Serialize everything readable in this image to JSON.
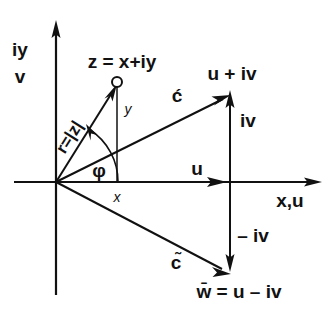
{
  "figure": {
    "colors": {
      "ink": "#111111",
      "background": "#ffffff"
    },
    "axes": {
      "vertical": {
        "label_line1": "iy",
        "label_line2": "v"
      },
      "horizontal": {
        "label": "x,u"
      }
    },
    "labels": {
      "z_point": "z = x+iy",
      "modulus": "r=|z|",
      "angle": "φ",
      "y_component": "y",
      "x_component": "x",
      "u_plus_iv": "u + iv",
      "iv_component": "iv",
      "u_component": "u",
      "neg_iv_component": "– iv",
      "c_acute": "ć",
      "c_tilde": "c̃",
      "w_conjugate": "w̄ = u – iv"
    },
    "points": {
      "origin": "0,0",
      "z": "x + iy",
      "w": "u + iv",
      "w_bar": "u - iv"
    },
    "vectors": [
      {
        "name": "r",
        "label": "r=|z|",
        "from": "origin",
        "to": "z"
      },
      {
        "name": "c-acute",
        "label": "ć",
        "from": "origin",
        "to": "u + iv"
      },
      {
        "name": "c-tilde",
        "label": "c̃",
        "from": "origin",
        "to": "u - iv"
      },
      {
        "name": "u",
        "label": "u",
        "from": "origin",
        "to": "u"
      },
      {
        "name": "iv",
        "label": "iv",
        "from": "u",
        "to": "u + iv"
      },
      {
        "name": "neg-iv",
        "label": "– iv",
        "from": "u",
        "to": "u - iv"
      }
    ]
  }
}
